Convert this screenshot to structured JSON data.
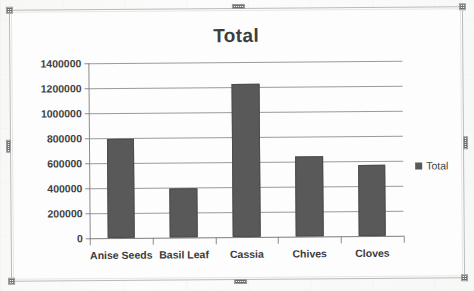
{
  "window": {
    "object_name": "chart-object",
    "selected": true,
    "handles": [
      "top-left",
      "top-center",
      "top-right",
      "middle-left",
      "middle-right",
      "bottom-left",
      "bottom-center",
      "bottom-right"
    ]
  },
  "colors": {
    "bar_fill": "#595959",
    "bar_border": "#4c4c4c",
    "gridline": "#9a9a9a",
    "axis_line": "#8b8b8b",
    "text": "#3f3f3f",
    "title_text": "#3d3d3d",
    "plot_background": "#fdfdfd",
    "frame_border": "#b9b9b9"
  },
  "legend": {
    "position": "right",
    "entries": [
      {
        "label": "Total",
        "color": "#595959"
      }
    ]
  },
  "chart_data": {
    "type": "bar",
    "title": "Total",
    "xlabel": "",
    "ylabel": "",
    "categories": [
      "Anise Seeds",
      "Basil Leaf",
      "Cassia",
      "Chives",
      "Cloves"
    ],
    "values": [
      795000,
      390000,
      1225000,
      640000,
      570000
    ],
    "series": [
      {
        "name": "Total",
        "values": [
          795000,
          390000,
          1225000,
          640000,
          570000
        ]
      }
    ],
    "ylim": [
      0,
      1400000
    ],
    "ytick_step": 200000,
    "ytick_labels": [
      "0",
      "200000",
      "400000",
      "600000",
      "800000",
      "1000000",
      "1200000",
      "1400000"
    ],
    "ytick_values": [
      0,
      200000,
      400000,
      600000,
      800000,
      1000000,
      1200000,
      1400000
    ],
    "grid": true,
    "grid_axis": "y",
    "legend_position": "right",
    "legend_entries": [
      "Total"
    ]
  }
}
